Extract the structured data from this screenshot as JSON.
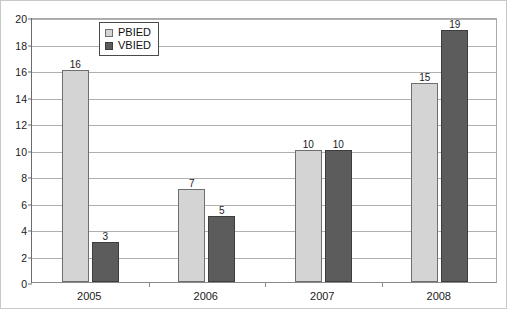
{
  "chart_data": {
    "type": "bar",
    "title": "",
    "subtitle": "",
    "xlabel": "",
    "ylabel": "",
    "categories": [
      "2005",
      "2006",
      "2007",
      "2008"
    ],
    "series": [
      {
        "name": "PBIED",
        "color": "#d4d4d4",
        "values": [
          16,
          7,
          10,
          15
        ]
      },
      {
        "name": "VBIED",
        "color": "#5c5c5c",
        "values": [
          3,
          5,
          10,
          19
        ]
      }
    ],
    "ylim": [
      0,
      20
    ],
    "y_ticks": [
      0,
      2,
      4,
      6,
      8,
      10,
      12,
      14,
      16,
      18,
      20
    ],
    "y_tick_labels": [
      "0",
      "2",
      "4",
      "6",
      "8",
      "10",
      "12",
      "14",
      "16",
      "18",
      "20"
    ],
    "grid": true,
    "grid_axis": "y",
    "legend_position": "top-left-inside",
    "data_labels": true,
    "data_label_values": [
      {
        "category": "2005",
        "PBIED": "16",
        "VBIED": "3"
      },
      {
        "category": "2006",
        "PBIED": "7",
        "VBIED": "5"
      },
      {
        "category": "2007",
        "PBIED": "10",
        "VBIED": "10"
      },
      {
        "category": "2008",
        "PBIED": "15",
        "VBIED": "19"
      }
    ]
  },
  "legend": {
    "entries": [
      {
        "label": "PBIED",
        "swatch": "legend-swatch-pbied"
      },
      {
        "label": "VBIED",
        "swatch": "legend-swatch-vbied"
      }
    ]
  }
}
